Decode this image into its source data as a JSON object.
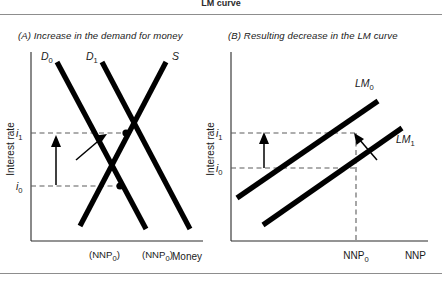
{
  "header": {
    "title": "LM curve"
  },
  "panels": {
    "a": {
      "caption": "(A) Increase in the demand for money",
      "y_axis_label": "Interest rate",
      "x_axis_label": "Money",
      "y_ticks": [
        {
          "id": "i1",
          "label": "i",
          "sub": "1",
          "value_y": 133
        },
        {
          "id": "i0",
          "label": "i",
          "sub": "0",
          "value_y": 186
        }
      ],
      "curves": [
        {
          "id": "D0",
          "label": "D",
          "sub": "0",
          "type": "demand",
          "note": "original money demand, downward sloping"
        },
        {
          "id": "D1",
          "label": "D",
          "sub": "1",
          "type": "demand",
          "note": "shifted money demand, downward sloping"
        },
        {
          "id": "S",
          "label": "S",
          "sub": "",
          "type": "supply",
          "note": "money supply, upward sloping"
        }
      ],
      "bottom_labels": [
        {
          "id": "nnp0-left",
          "text": "(NNP",
          "sub": "0",
          "tail": ")"
        },
        {
          "id": "nnp0-right",
          "text": "(NNP",
          "sub": "0",
          "tail": ")"
        }
      ],
      "annotations": {
        "shift_arrow": "arrow showing demand curve shifting right",
        "rate_arrow": "upward arrow showing interest rate rising from i0 to i1"
      }
    },
    "b": {
      "caption": "(B) Resulting decrease in the LM curve",
      "y_axis_label": "Interest rate",
      "x_axis_label": "NNP",
      "y_ticks": [
        {
          "id": "i1",
          "label": "i",
          "sub": "1",
          "value_y": 133
        },
        {
          "id": "i0",
          "label": "i",
          "sub": "0",
          "value_y": 167
        }
      ],
      "curves": [
        {
          "id": "LM0",
          "label": "LM",
          "sub": "0",
          "note": "original LM curve, upward sloping"
        },
        {
          "id": "LM1",
          "label": "LM",
          "sub": "1",
          "note": "shifted LM curve, upward sloping, below and right"
        }
      ],
      "x_ticks": [
        {
          "id": "nnp0",
          "label": "NNP",
          "sub": "0"
        }
      ],
      "annotations": {
        "shift_arrow": "arrow showing LM curve shifting up-left",
        "rate_arrow": "upward arrow showing interest rate rising from i0 to i1"
      }
    }
  },
  "colors": {
    "curve": "#000000",
    "axis": "#2a2a2a",
    "dash": "#5d5d5d",
    "rule": "#8d8d8d",
    "text": "#1a1a1a",
    "background": "#ffffff"
  }
}
